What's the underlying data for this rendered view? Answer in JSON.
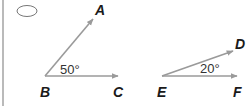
{
  "figure": {
    "marker": "oval",
    "colors": {
      "ray": "#9a9a9a",
      "label": "#1a1a1a",
      "angle_text": "#333333",
      "frame": "#8c8c8c"
    },
    "angles": [
      {
        "name": "angle-ABC",
        "vertex": {
          "label": "B",
          "x": 45,
          "y": 76
        },
        "ray1": {
          "label": "A",
          "x": 93,
          "y": 19
        },
        "ray2": {
          "label": "C",
          "x": 118,
          "y": 76
        },
        "measure": "50°"
      },
      {
        "name": "angle-DEF",
        "vertex": {
          "label": "E",
          "x": 162,
          "y": 76
        },
        "ray1": {
          "label": "D",
          "x": 233,
          "y": 51
        },
        "ray2": {
          "label": "F",
          "x": 237,
          "y": 76
        },
        "measure": "20°"
      }
    ]
  }
}
